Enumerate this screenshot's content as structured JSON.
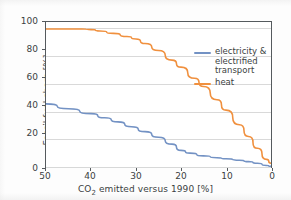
{
  "chart_data": {
    "type": "line",
    "title": "",
    "xlabel": "CO2 emitted versus 1990 [%]",
    "xlabel_parts": {
      "pre": "CO",
      "sub": "2",
      "post": " emitted versus 1990 [%]"
    },
    "ylabel": "Fossil fuel share [%]",
    "xlim": [
      50,
      0
    ],
    "ylim": [
      0,
      105
    ],
    "x_axis_inverted": true,
    "xticks": [
      50,
      40,
      30,
      20,
      10,
      0
    ],
    "yticks": [
      0,
      20,
      40,
      60,
      80,
      100
    ],
    "xticklabels": [
      "50",
      "40",
      "30",
      "20",
      "10",
      "0"
    ],
    "yticklabels": [
      "0",
      "20",
      "40",
      "60",
      "80",
      "100"
    ],
    "grid": "horizontal",
    "legend_position": "upper right",
    "series": [
      {
        "name": "electricity & electrified transport",
        "legend_label": "electricity &\nelectrified\ntransport",
        "color": "#7392c4",
        "x": [
          50,
          45,
          40,
          37,
          34,
          31,
          28,
          25,
          22,
          20,
          18,
          15,
          12,
          10,
          7,
          5,
          3,
          1,
          0
        ],
        "values": [
          46,
          42.5,
          39,
          36,
          33,
          29.5,
          26,
          22,
          17,
          12.5,
          10.5,
          8.5,
          7.2,
          6.4,
          5.4,
          4.4,
          3.2,
          1.6,
          1
        ]
      },
      {
        "name": "heat",
        "legend_label": "heat",
        "color": "#f0903e",
        "x": [
          50,
          45,
          42,
          40,
          38,
          35,
          32,
          30,
          28,
          25,
          22,
          20,
          17,
          15,
          12,
          10,
          7,
          5,
          3,
          1,
          0
        ],
        "values": [
          100,
          100,
          100,
          99.5,
          98.5,
          96.8,
          94.5,
          92.8,
          89.5,
          84.5,
          77.5,
          72.5,
          64.5,
          58.5,
          49,
          41.5,
          31,
          22.5,
          14,
          6,
          3.2
        ]
      }
    ]
  }
}
